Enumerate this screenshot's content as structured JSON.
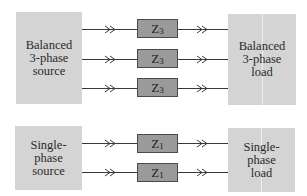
{
  "three_phase": {
    "source_label": "Balanced\n3-phase\nsource",
    "load_label": "Balanced\n3-phase\nload",
    "impedances": [
      {
        "symbol": "Z",
        "subscript": "3"
      },
      {
        "symbol": "Z",
        "subscript": "3"
      },
      {
        "symbol": "Z",
        "subscript": "3"
      }
    ]
  },
  "single_phase": {
    "source_label": "Single-\nphase\nsource",
    "load_label": "Single-\nphase\nload",
    "impedances": [
      {
        "symbol": "Z",
        "subscript": "1"
      },
      {
        "symbol": "Z",
        "subscript": "1"
      }
    ]
  },
  "colors": {
    "block_fill": "#d4d4d4",
    "impedance_fill": "#9a9a9a",
    "wire": "#3a3a3a"
  }
}
